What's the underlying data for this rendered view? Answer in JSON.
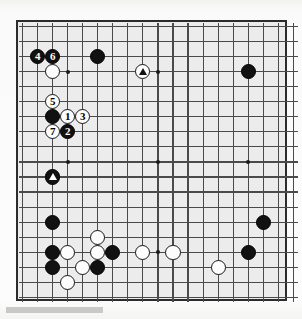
{
  "diagram": {
    "kind": "go-board-diagram",
    "board": {
      "columns": 18,
      "rows": 19,
      "partial_view": true,
      "background_color": "#ececec",
      "line_color": "#4a4a4a",
      "border_color": "#2b2b2b",
      "black_stone_color": "#111111",
      "white_stone_color": "#fdfdfd"
    },
    "star_points": [
      {
        "col": 3,
        "row": 3
      },
      {
        "col": 9,
        "row": 3
      },
      {
        "col": 15,
        "row": 3
      },
      {
        "col": 3,
        "row": 9
      },
      {
        "col": 9,
        "row": 9
      },
      {
        "col": 15,
        "row": 9
      },
      {
        "col": 3,
        "row": 15
      },
      {
        "col": 9,
        "row": 15
      },
      {
        "col": 15,
        "row": 15
      }
    ],
    "numbered_moves": [
      {
        "label": "1",
        "color": "white",
        "col": 3,
        "row": 6
      },
      {
        "label": "2",
        "color": "black",
        "col": 3,
        "row": 7
      },
      {
        "label": "3",
        "color": "white",
        "col": 4,
        "row": 6
      },
      {
        "label": "4",
        "color": "black",
        "col": 1,
        "row": 2
      },
      {
        "label": "5",
        "color": "white",
        "col": 2,
        "row": 5
      },
      {
        "label": "6",
        "color": "black",
        "col": 2,
        "row": 2
      },
      {
        "label": "7",
        "color": "white",
        "col": 2,
        "row": 7
      }
    ],
    "marked_stones": [
      {
        "marker": "triangle",
        "color": "white",
        "col": 8,
        "row": 3
      },
      {
        "marker": "triangle",
        "color": "black",
        "col": 2,
        "row": 10
      }
    ],
    "plain_stones": [
      {
        "color": "black",
        "col": 5,
        "row": 2
      },
      {
        "color": "white",
        "col": 2,
        "row": 3
      },
      {
        "color": "black",
        "col": 2,
        "row": 6
      },
      {
        "color": "black",
        "col": 15,
        "row": 3
      },
      {
        "color": "black",
        "col": 2,
        "row": 13
      },
      {
        "color": "white",
        "col": 5,
        "row": 14
      },
      {
        "color": "black",
        "col": 2,
        "row": 15
      },
      {
        "color": "white",
        "col": 3,
        "row": 15
      },
      {
        "color": "white",
        "col": 5,
        "row": 15
      },
      {
        "color": "black",
        "col": 6,
        "row": 15
      },
      {
        "color": "white",
        "col": 8,
        "row": 15
      },
      {
        "color": "white",
        "col": 10,
        "row": 15
      },
      {
        "color": "black",
        "col": 15,
        "row": 15
      },
      {
        "color": "black",
        "col": 16,
        "row": 13
      },
      {
        "color": "black",
        "col": 2,
        "row": 16
      },
      {
        "color": "white",
        "col": 4,
        "row": 16
      },
      {
        "color": "black",
        "col": 5,
        "row": 16
      },
      {
        "color": "white",
        "col": 13,
        "row": 16
      },
      {
        "color": "white",
        "col": 3,
        "row": 17
      }
    ],
    "footer_bar": {
      "visible": true,
      "color": "#c9c9c9"
    }
  }
}
